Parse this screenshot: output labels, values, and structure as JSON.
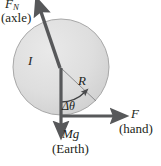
{
  "figure": {
    "kind": "physics-free-body-diagram",
    "width": 161,
    "height": 166,
    "background": "#ffffff"
  },
  "disc": {
    "center_x": 61,
    "center_y": 67,
    "radius": 48,
    "fill": "#dcdcdc",
    "stroke": "#a8a8a8",
    "shade_light": "#e8e8e8",
    "shade_dark": "#cfcfcf"
  },
  "colors": {
    "arrow_dark": "#57585a",
    "arrow_darker": "#4a4b4d",
    "thin_line": "#8c8d8f",
    "text": "#231f20"
  },
  "labels": {
    "normal_force_symbol": "F",
    "normal_force_subscript": "N",
    "normal_force_source": "(axle)",
    "inertia_symbol": "I",
    "radius_symbol": "R",
    "angle_symbol": "Δθ",
    "weight_symbol": "Mg",
    "weight_source": "(Earth)",
    "applied_force_symbol": "F",
    "applied_force_source": "(hand)"
  },
  "vectors": [
    {
      "name": "normal-force-arrow",
      "symbol": "F_N",
      "source": "axle",
      "from_x": 60,
      "from_y": 68,
      "to_x": 38,
      "to_y": 3,
      "direction": "up-left"
    },
    {
      "name": "weight-arrow",
      "symbol": "Mg",
      "source": "Earth",
      "from_x": 61,
      "from_y": 68,
      "to_x": 61,
      "to_y": 133,
      "direction": "down"
    },
    {
      "name": "applied-force-arrow",
      "symbol": "F",
      "source": "hand",
      "from_x": 61,
      "from_y": 116,
      "to_x": 122,
      "to_y": 116,
      "direction": "right"
    }
  ],
  "radius_line": {
    "name": "radius-line",
    "symbol": "R",
    "from_x": 61,
    "from_y": 68,
    "to_x": 96,
    "to_y": 101
  },
  "angle_arc": {
    "name": "angle-arc",
    "symbol": "Δθ",
    "center_x": 61,
    "center_y": 68,
    "radius": 34,
    "start_deg": 90,
    "end_deg": 43,
    "arrow_at": "end"
  }
}
